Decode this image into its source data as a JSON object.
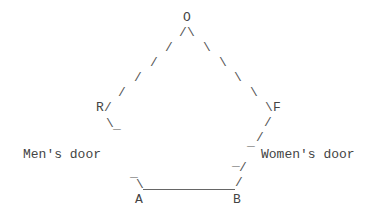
{
  "diagram": {
    "type": "ascii-art",
    "nodes": {
      "O": "O",
      "R": "R",
      "F": "F",
      "A": "A",
      "B": "B"
    },
    "labels": {
      "mens_door": "Men's door",
      "womens_door": "Women's door"
    },
    "glyphs": {
      "slash": "/",
      "backslash": "\\",
      "underscore": "_"
    },
    "edges": [
      {
        "from": "O",
        "to": "R",
        "style": "dashed"
      },
      {
        "from": "O",
        "to": "F",
        "style": "dashed"
      },
      {
        "from": "R",
        "to": "A",
        "style": "gap",
        "note": "Men's door"
      },
      {
        "from": "F",
        "to": "B",
        "style": "dashed",
        "note": "Women's door"
      },
      {
        "from": "A",
        "to": "B",
        "style": "solid"
      }
    ]
  }
}
